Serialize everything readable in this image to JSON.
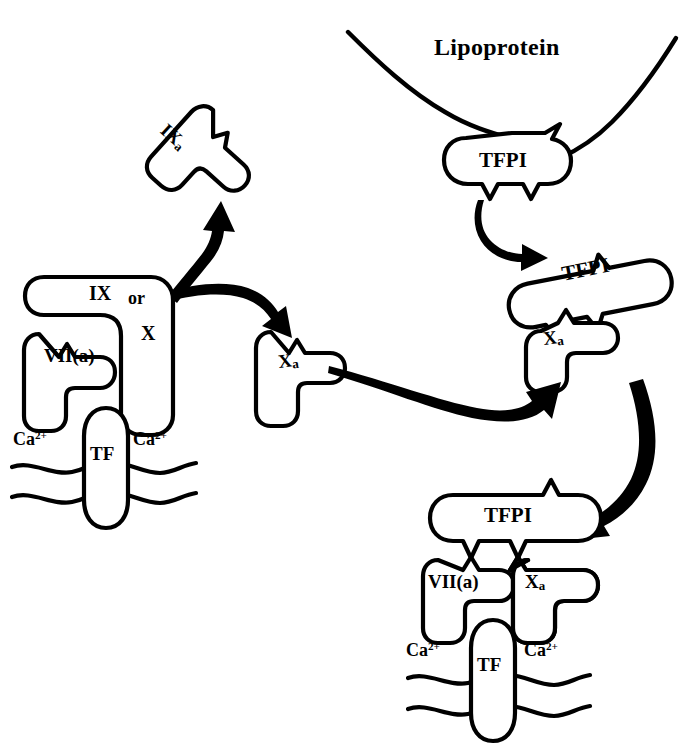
{
  "figure": {
    "type": "biochemical-pathway-diagram",
    "ink_color": "#000000",
    "background_color": "#ffffff"
  },
  "labels": {
    "lipoprotein": "Lipoprotein",
    "tfpi": "TFPI",
    "tf": "TF",
    "viia": "VII(a)",
    "ix": "IX",
    "or": "or",
    "x": "X",
    "ixa_roman": "IX",
    "xa_roman": "X",
    "subscript_a": "a",
    "calcium": "Ca",
    "calcium_charge": "2+"
  },
  "complexes": [
    {
      "id": "tf-viia-substrate",
      "name": "TF / VII(a) / IX-or-X membrane complex",
      "members": [
        "VII(a)",
        "IX or X",
        "TF",
        "Ca2+",
        "Ca2+"
      ]
    },
    {
      "id": "free-ixa",
      "name": "free activated factor IXa",
      "members": [
        "IXa"
      ]
    },
    {
      "id": "free-xa",
      "name": "free activated factor Xa",
      "members": [
        "Xa"
      ]
    },
    {
      "id": "lipoprotein-tfpi",
      "name": "lipoprotein-bound TFPI",
      "members": [
        "Lipoprotein",
        "TFPI"
      ]
    },
    {
      "id": "tfpi-xa",
      "name": "TFPI bound to Xa",
      "members": [
        "TFPI",
        "Xa"
      ]
    },
    {
      "id": "tfpi-viia-xa-tf",
      "name": "quaternary TFPI / Xa / VII(a) / TF membrane complex",
      "members": [
        "TFPI",
        "VII(a)",
        "Xa",
        "TF",
        "Ca2+",
        "Ca2+"
      ]
    }
  ],
  "arrows": [
    {
      "id": "to-ixa",
      "from": "tf-viia-substrate",
      "to": "free-ixa",
      "style": "curved-tapered"
    },
    {
      "id": "to-xa",
      "from": "tf-viia-substrate",
      "to": "free-xa",
      "style": "curved-tapered"
    },
    {
      "id": "tfpi-release",
      "from": "lipoprotein-tfpi",
      "to": "tfpi-xa",
      "style": "curved-tapered"
    },
    {
      "id": "xa-capture",
      "from": "free-xa",
      "to": "tfpi-xa",
      "style": "long-sweeping"
    },
    {
      "id": "quaternary-formation",
      "from": "tfpi-xa",
      "to": "tfpi-viia-xa-tf",
      "style": "large-arc"
    }
  ]
}
